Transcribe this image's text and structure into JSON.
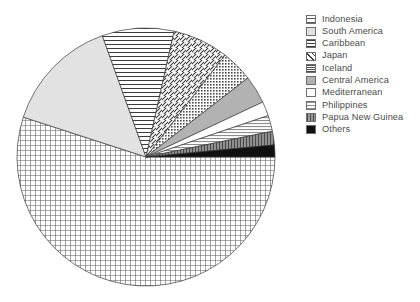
{
  "chart_data": {
    "type": "pie",
    "title": "",
    "legend_position": "right",
    "grid": false,
    "categories": [
      "Indonesia",
      "South America",
      "Caribbean",
      "Japan",
      "Iceland",
      "Central America",
      "Mediterranean",
      "Philippines",
      "Papua New Guinea",
      "Others"
    ],
    "values": [
      55.0,
      14.5,
      9.0,
      7.0,
      4.0,
      3.5,
      1.8,
      2.0,
      1.7,
      1.5
    ],
    "units": "percent",
    "start_angle_deg": 0,
    "direction": "clockwise",
    "slices": [
      {
        "label": "Indonesia",
        "value": 55.0,
        "pattern": "crosshatch-grid",
        "color": "#dcdcdc"
      },
      {
        "label": "South America",
        "value": 14.5,
        "pattern": "solid-light",
        "color": "#e3e3e3"
      },
      {
        "label": "Caribbean",
        "value": 9.0,
        "pattern": "horizontal-lines",
        "color": "#ffffff"
      },
      {
        "label": "Japan",
        "value": 7.0,
        "pattern": "diagonal-hatch",
        "color": "#ffffff"
      },
      {
        "label": "Iceland",
        "value": 4.0,
        "pattern": "dense-dots",
        "color": "#c8c8c8"
      },
      {
        "label": "Central America",
        "value": 3.5,
        "pattern": "solid-gray",
        "color": "#b4b4b4"
      },
      {
        "label": "Mediterranean",
        "value": 1.8,
        "pattern": "solid-white",
        "color": "#ffffff"
      },
      {
        "label": "Philippines",
        "value": 2.0,
        "pattern": "fine-horizontal",
        "color": "#d2d2d2"
      },
      {
        "label": "Papua New Guinea",
        "value": 1.7,
        "pattern": "vertical-lines",
        "color": "#9a9a9a"
      },
      {
        "label": "Others",
        "value": 1.5,
        "pattern": "solid-black",
        "color": "#111111"
      }
    ]
  },
  "legend": {
    "items": [
      {
        "label": "Indonesia"
      },
      {
        "label": "South America"
      },
      {
        "label": "Caribbean"
      },
      {
        "label": "Japan"
      },
      {
        "label": "Iceland"
      },
      {
        "label": "Central America"
      },
      {
        "label": "Mediterranean"
      },
      {
        "label": "Philippines"
      },
      {
        "label": "Papua New Guinea"
      },
      {
        "label": "Others"
      }
    ]
  }
}
